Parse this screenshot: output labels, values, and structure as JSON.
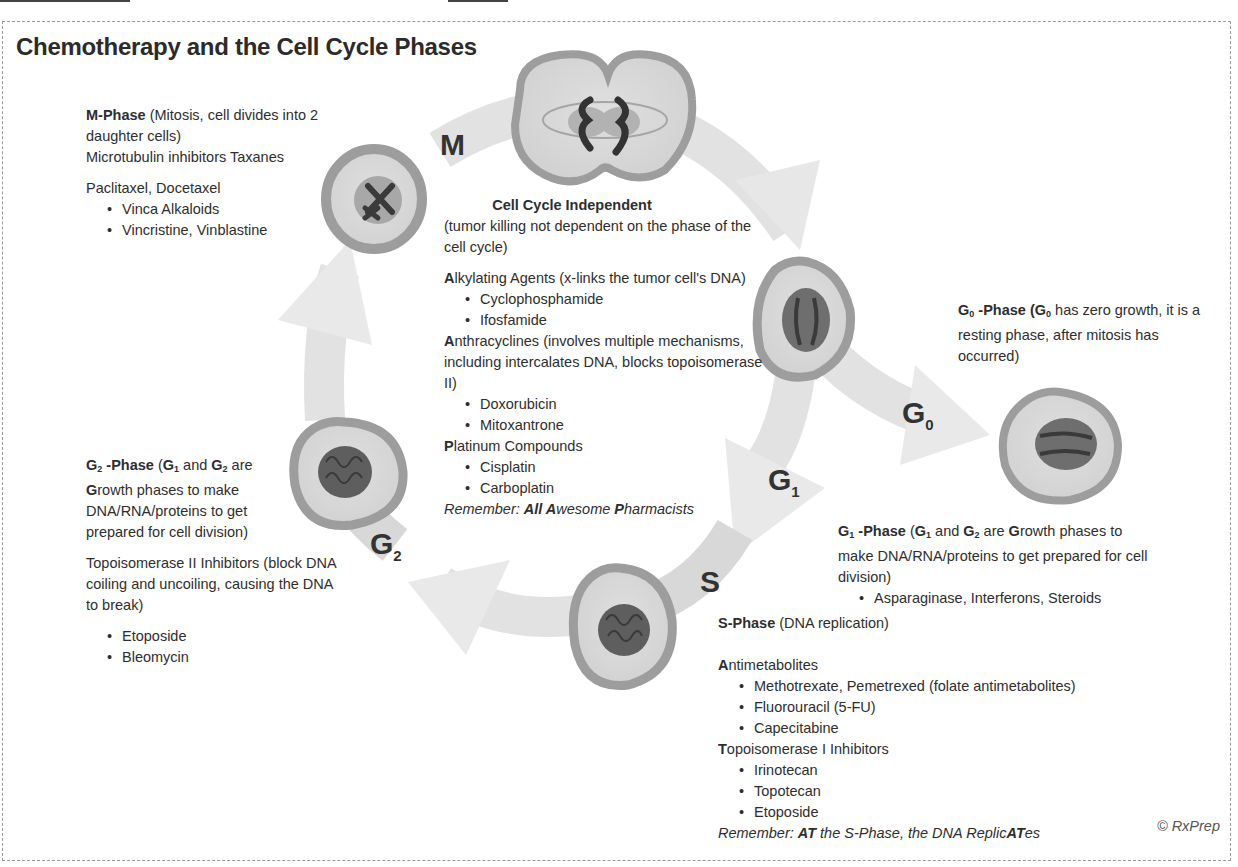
{
  "title": "Chemotherapy and the Cell Cycle Phases",
  "colors": {
    "arrow": "#e4e4e4",
    "arrow_dark": "#d2d2d2",
    "cell_membrane": "#9e9e9e",
    "cytoplasm": "#dadada",
    "nucleus": "#6d6d6d",
    "nucleus_light": "#a9a9a9",
    "chromosome": "#333333",
    "text": "#2e2e2e"
  },
  "phase_labels": {
    "m": {
      "main": "M",
      "sub": ""
    },
    "g0": {
      "main": "G",
      "sub": "0"
    },
    "g1": {
      "main": "G",
      "sub": "1"
    },
    "s": {
      "main": "S",
      "sub": ""
    },
    "g2": {
      "main": "G",
      "sub": "2"
    }
  },
  "m_phase": {
    "heading": "M-Phase",
    "heading_rest": " (Mitosis, cell divides into 2 daughter cells)",
    "line2": "Microtubulin inhibitors Taxanes",
    "drugs_intro": "Paclitaxel, Docetaxel",
    "bullets": [
      "Vinca Alkaloids",
      "Vincristine, Vinblastine"
    ]
  },
  "cell_cycle_independent": {
    "heading": "Cell Cycle Independent",
    "subheading": "(tumor killing not dependent on the phase of the cell cycle)",
    "groups": [
      {
        "initial": "A",
        "name": "lkylating Agents (x-links the tumor cell's DNA)",
        "bullets": [
          "Cyclophosphamide",
          "Ifosfamide"
        ]
      },
      {
        "initial": "A",
        "name": "nthracyclines (involves multiple mechanisms, including intercalates DNA, blocks topoisomerase II)",
        "bullets": [
          "Doxorubicin",
          "Mitoxantrone"
        ]
      },
      {
        "initial": "P",
        "name": "latinum Compounds",
        "bullets": [
          "Cisplatin",
          "Carboplatin"
        ]
      }
    ],
    "mnemonic_prefix": "Remember: ",
    "mnemonic_parts": [
      {
        "text": "A",
        "bold": true
      },
      {
        "text": "ll ",
        "bold": true
      },
      {
        "text": "A",
        "bold": true
      },
      {
        "text": "wesome ",
        "bold": false
      },
      {
        "text": "P",
        "bold": true
      },
      {
        "text": "harmacists",
        "bold": false
      }
    ]
  },
  "g0_phase": {
    "heading_main": "G",
    "heading_sub": "0",
    "heading_rest": " -Phase",
    "paren_main": " (G",
    "paren_sub": "0",
    "description": " has zero growth, it is a resting phase, after mitosis has occurred)"
  },
  "g1_phase": {
    "heading_main": "G",
    "heading_sub": "1",
    "heading_rest": " -Phase",
    "description_a": " (",
    "g1": "G",
    "g1_sub": "1",
    "and": " and ",
    "g2": "G",
    "g2_sub": "2",
    "are": " are ",
    "growth_initial": "G",
    "description_b": "rowth phases to make DNA/RNA/proteins to get prepared for cell division)",
    "bullets": [
      "Asparaginase, Interferons, Steroids"
    ]
  },
  "g2_phase": {
    "heading_main": "G",
    "heading_sub": "2",
    "heading_rest": " -Phase",
    "description_a": " (",
    "g1": "G",
    "g1_sub": "1",
    "and": " and ",
    "g2": "G",
    "g2_sub": "2",
    "are": " are ",
    "growth_initial": "G",
    "description_b": "rowth phases to make DNA/RNA/proteins to get prepared for cell division)",
    "drug_class": "Topoisomerase II Inhibitors (block DNA coiling and uncoiling, causing the DNA to break)",
    "bullets": [
      "Etoposide",
      "Bleomycin"
    ]
  },
  "s_phase": {
    "heading": "S-Phase",
    "heading_rest": " (DNA replication)",
    "groups": [
      {
        "initial": "A",
        "name": "ntimetabolites",
        "bullets": [
          "Methotrexate, Pemetrexed (folate antimetabolites)",
          "Fluorouracil (5-FU)",
          "Capecitabine"
        ]
      },
      {
        "initial": "T",
        "name": "opoisomerase I Inhibitors",
        "bullets": [
          "Irinotecan",
          "Topotecan",
          "Etoposide"
        ]
      }
    ],
    "mnemonic_prefix": "Remember: ",
    "mnemonic_bold1": "AT",
    "mnemonic_mid": " the S-Phase, the DNA Replic",
    "mnemonic_bold2": "AT",
    "mnemonic_end": "es"
  },
  "copyright": "© RxPrep"
}
